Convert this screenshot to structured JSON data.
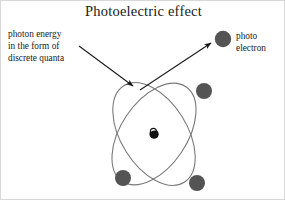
{
  "figure": {
    "title": "Photoelectric effect",
    "background_color": "#ffffff",
    "border_color": "#d8d8d8"
  },
  "annotations": {
    "photon": {
      "name": "photon energy annotation",
      "line1": "photon energy",
      "line2": "in the form of",
      "line3": "discrete quanta"
    },
    "photoelectron": {
      "name": "photo electron annotation",
      "line1": "photo",
      "line2": "electron"
    }
  },
  "diagram": {
    "type": "atom-photoelectric-effect",
    "nucleus": {
      "cx": 153,
      "cy": 133,
      "r": 4.6,
      "color": "#101010"
    },
    "orbits": [
      {
        "id": "orbit-left-tilt",
        "cx": 153,
        "cy": 133,
        "rx": 33,
        "ry": 57,
        "rotation": -32,
        "stroke": "#7a7a7a",
        "stroke_width": 1.1
      },
      {
        "id": "orbit-right-tilt",
        "cx": 153,
        "cy": 133,
        "rx": 33,
        "ry": 57,
        "rotation": 34,
        "stroke": "#7a7a7a",
        "stroke_width": 1.1
      }
    ],
    "orbital_electrons": [
      {
        "id": "electron-upper-right",
        "cx": 203,
        "cy": 90,
        "r": 8,
        "color": "#545454"
      },
      {
        "id": "electron-lower-left",
        "cx": 122,
        "cy": 177,
        "r": 8,
        "color": "#545454"
      },
      {
        "id": "electron-lower-right",
        "cx": 196,
        "cy": 182,
        "r": 8,
        "color": "#545454"
      }
    ],
    "photo_electron": {
      "id": "photo-electron",
      "cx": 222,
      "cy": 38,
      "r": 8.2,
      "color": "#545454"
    },
    "arrows": [
      {
        "id": "incoming-photon-arrow",
        "x1": 78,
        "y1": 45,
        "x2": 134,
        "y2": 86,
        "stroke": "#1a1a1a",
        "stroke_width": 1.1
      },
      {
        "id": "ejected-electron-arrow",
        "x1": 139,
        "y1": 89,
        "x2": 212,
        "y2": 41,
        "stroke": "#1a1a1a",
        "stroke_width": 1.1
      }
    ]
  }
}
